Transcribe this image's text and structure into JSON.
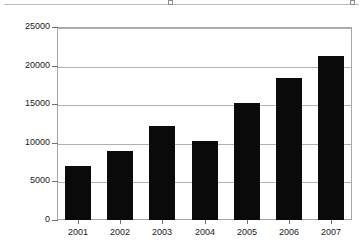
{
  "clipped_header": {
    "ghost_text": "",
    "handle_icon": "resize-handle-icon"
  },
  "chart_data": {
    "type": "bar",
    "title": "",
    "subtitle": "",
    "xlabel": "",
    "ylabel": "",
    "categories": [
      "2001",
      "2002",
      "2003",
      "2004",
      "2005",
      "2006",
      "2007"
    ],
    "values": [
      7000,
      9000,
      12200,
      10200,
      15200,
      18400,
      21300
    ],
    "series": [
      {
        "name": "",
        "values": [
          7000,
          9000,
          12200,
          10200,
          15200,
          18400,
          21300
        ],
        "color": "#0a0a0a"
      }
    ],
    "ylim": [
      0,
      25000
    ],
    "ytick_values": [
      0,
      5000,
      10000,
      15000,
      20000,
      25000
    ],
    "ytick_labels": [
      "0",
      "5000",
      "10000",
      "15000",
      "20000",
      "25000"
    ],
    "xtick_labels": [
      "2001",
      "2002",
      "2003",
      "2004",
      "2005",
      "2006",
      "2007"
    ],
    "grid": true,
    "grid_axis": "y",
    "grid_color": "#b0b0b0",
    "legend": false,
    "legend_position": "none",
    "frame_color": "#a6a6a6",
    "plot_background": "#ffffff",
    "bar_color": "#0a0a0a",
    "annotations": []
  }
}
